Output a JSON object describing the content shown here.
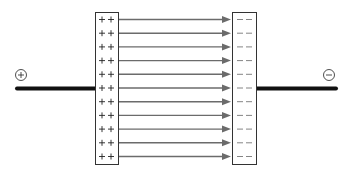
{
  "diagram": {
    "type": "parallel-plate-capacitor",
    "positive_terminal": {
      "symbol": "+",
      "label": "positive-terminal"
    },
    "negative_terminal": {
      "symbol": "−",
      "label": "negative-terminal"
    },
    "left_plate": {
      "charge_symbol": "+",
      "rows": 11,
      "charges_per_row": 2
    },
    "right_plate": {
      "charge_symbol": "−",
      "rows": 11,
      "charges_per_row": 2
    },
    "field_lines": {
      "count": 11,
      "direction": "left-to-right"
    },
    "colors": {
      "wire": "#111111",
      "plate_border": "#333333",
      "field_line": "#6b6b6b",
      "plus_sign": "#222222",
      "minus_sign": "#777777"
    }
  }
}
